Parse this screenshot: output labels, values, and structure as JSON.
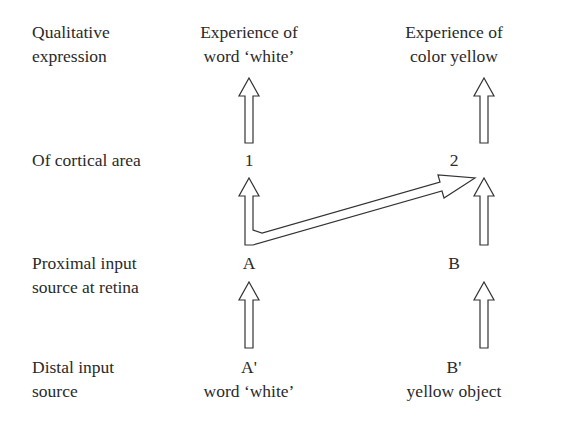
{
  "rows": {
    "qualitative": {
      "label_line1": "Qualitative",
      "label_line2": "expression",
      "col1_line1": "Experience of",
      "col1_line2": "word ‘white’",
      "col2_line1": "Experience of",
      "col2_line2": "color yellow"
    },
    "cortical": {
      "label": "Of cortical area",
      "col1": "1",
      "col2": "2"
    },
    "proximal": {
      "label_line1": "Proximal input",
      "label_line2": "source at retina",
      "col1": "A",
      "col2": "B"
    },
    "distal": {
      "label_line1": "Distal input",
      "label_line2": "source",
      "col1_line1": "A'",
      "col1_line2": "word ‘white’",
      "col2_line1": "B'",
      "col2_line2": "yellow object"
    }
  },
  "colors": {
    "stroke": "#333333",
    "text": "#2a2a2a",
    "background": "#ffffff"
  }
}
